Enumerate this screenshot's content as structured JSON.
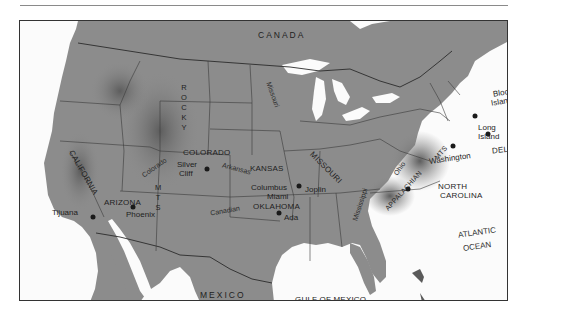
{
  "map": {
    "title": "United States site map",
    "colors": {
      "land": "#8c8c8c",
      "land_dark": "#6f6f6f",
      "water": "#fbfbfb",
      "border": "#2b2b2b",
      "text": "#1e1e1e"
    },
    "regions": {
      "canada": "CANADA",
      "mexico": "MEXICO",
      "gulf": "GULF OF MEXICO",
      "atlantic_1": "ATLANTIC",
      "atlantic_2": "OCEAN"
    },
    "states": {
      "california": "CALIFORNIA",
      "arizona": "ARIZONA",
      "colorado": "COLORADO",
      "kansas": "KANSAS",
      "missouri": "MISSOURI",
      "oklahoma": "OKLAHOMA",
      "north_carolina_1": "NORTH",
      "north_carolina_2": "CAROLINA",
      "delaware": "DELAWARE"
    },
    "mountains": {
      "rocky": "ROCKY",
      "mts": "MTS",
      "appalachian": "APPALACHIAN",
      "appalachian_mts": "MTS"
    },
    "rivers": {
      "missouri": "Missouri",
      "colorado": "Colorado",
      "arkansas": "Arkansas",
      "canadian": "Canadian",
      "mississippi": "Mississippi",
      "ohio": "Ohio"
    },
    "sites": [
      {
        "name": "Tijuana"
      },
      {
        "name": "Phoenix"
      },
      {
        "name": "Silver Cliff"
      },
      {
        "name": "Columbus"
      },
      {
        "name": "Joplin"
      },
      {
        "name": "Miami"
      },
      {
        "name": "Ada"
      },
      {
        "name": "Washington"
      },
      {
        "name": "Long Island"
      },
      {
        "name": "Block Island"
      }
    ],
    "site_labels": {
      "tijuana": "Tijuana",
      "phoenix": "Phoenix",
      "silver": "Silver",
      "cliff": "Cliff",
      "columbus": "Columbus",
      "joplin": "Joplin",
      "miami": "Miami",
      "ada": "Ada",
      "washington": "Washington",
      "long": "Long",
      "long_island": "Island",
      "block": "Block",
      "block_island": "Island"
    }
  }
}
